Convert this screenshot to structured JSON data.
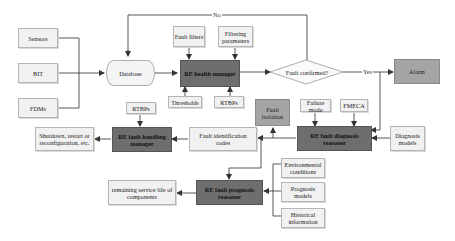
{
  "diagram": {
    "inputs": {
      "sensors": "Sensors",
      "bit": "BIT",
      "fdms": "FDMs"
    },
    "database": "Database",
    "health_manager": {
      "title": "RE health manager",
      "inputs_top": [
        "Fault filters",
        "Filtering parameters"
      ],
      "inputs_bottom": [
        "Thresholds",
        "RTBPs"
      ]
    },
    "decision": {
      "label": "Fault confirmed?",
      "no_label": "No",
      "yes_label": "Yes"
    },
    "alarm": "Alarm",
    "diagnosis_reasoner": {
      "title_line1": "RE fault diagnosis",
      "title_line2": "reasoner",
      "inputs_top": [
        "Failure mode",
        "FMECA"
      ],
      "input_right": "Diagnosis models"
    },
    "fault_isolation": "Fault isolation",
    "fault_identification": "Fault identification codes",
    "handling_manager": {
      "title_line1": "RE fault handling",
      "title_line2": "manager",
      "input_top": "RTBPs"
    },
    "handling_output": "Shutdown, restart or reconfiguration, etc.",
    "prognosis_reasoner": {
      "title_line1": "RE fault prognosis",
      "title_line2": "reasoner",
      "inputs_right": [
        "Environmental conditions",
        "Prognosis models",
        "Historical information"
      ]
    },
    "prognosis_output": "remaining service life of components",
    "colors": {
      "dark_box": "#6e6e6e",
      "mid_box": "#a4a4a4",
      "light_box": "#f1f1f1",
      "line": "#333333"
    }
  }
}
